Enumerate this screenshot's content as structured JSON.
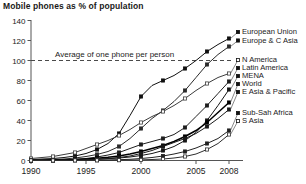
{
  "chart_data": {
    "type": "line",
    "title": "Mobile phones as % of population",
    "xlabel": "",
    "ylabel": "",
    "xlim": [
      1990,
      2008
    ],
    "ylim": [
      0,
      140
    ],
    "yticks": [
      0,
      20,
      40,
      60,
      80,
      100,
      120,
      140
    ],
    "xticks": [
      1990,
      1995,
      2000,
      2005,
      2008
    ],
    "xtick_labels": [
      "1990",
      "1995",
      "2000",
      "2005",
      "2008"
    ],
    "ytick_labels": [
      "0",
      "20",
      "40",
      "60",
      "80",
      "100",
      "120",
      "140"
    ],
    "grid": false,
    "legend_position": "right-inline",
    "annotations": [
      {
        "text": "Average of one phone per person",
        "y": 100,
        "x": 1997.6,
        "style": "dashed-reference-line"
      }
    ],
    "x": [
      1990,
      1991,
      1992,
      1993,
      1994,
      1995,
      1996,
      1997,
      1998,
      1999,
      2000,
      2001,
      2002,
      2003,
      2004,
      2005,
      2006,
      2007,
      2008
    ],
    "series": [
      {
        "name": "European Union",
        "marker": "filled-square",
        "values": [
          1,
          1.5,
          2,
          3,
          4.5,
          7,
          11,
          17,
          27,
          45,
          64,
          75,
          80,
          85,
          92,
          100,
          109,
          116,
          122
        ]
      },
      {
        "name": "Europe & C Asia",
        "marker": "filled-square",
        "values": [
          0.5,
          0.7,
          1,
          1.5,
          2.5,
          4,
          6,
          9,
          14,
          22,
          32,
          42,
          50,
          59,
          70,
          83,
          96,
          106,
          114
        ]
      },
      {
        "name": "N America",
        "marker": "open-square",
        "values": [
          2,
          3,
          4,
          6,
          8,
          12,
          16,
          20,
          25,
          31,
          38,
          44,
          49,
          55,
          62,
          70,
          77,
          83,
          87
        ]
      },
      {
        "name": "Latin America",
        "marker": "filled-square",
        "values": [
          0.2,
          0.3,
          0.5,
          0.8,
          1.2,
          2,
          3.5,
          5.5,
          8,
          12,
          16,
          19,
          22,
          26,
          33,
          44,
          55,
          67,
          79
        ]
      },
      {
        "name": "MENA",
        "marker": "filled-square",
        "values": [
          0.1,
          0.15,
          0.2,
          0.3,
          0.5,
          0.8,
          1.2,
          1.8,
          2.5,
          3.5,
          5,
          7,
          10,
          14,
          20,
          28,
          40,
          55,
          71
        ]
      },
      {
        "name": "World",
        "marker": "filled-square",
        "values": [
          0.2,
          0.3,
          0.4,
          0.6,
          0.9,
          1.5,
          2.2,
          3.2,
          4.5,
          6.5,
          9,
          12,
          15,
          19,
          24,
          30,
          38,
          48,
          58
        ]
      },
      {
        "name": "E Asia & Pacific",
        "marker": "filled-square",
        "values": [
          0.1,
          0.15,
          0.2,
          0.3,
          0.5,
          0.8,
          1.3,
          2,
          3,
          4.5,
          7,
          10,
          14,
          18,
          22,
          27,
          34,
          42,
          51
        ]
      },
      {
        "name": "Sub-Sah Africa",
        "marker": "filled-square",
        "values": [
          0.05,
          0.05,
          0.08,
          0.1,
          0.15,
          0.2,
          0.3,
          0.5,
          0.8,
          1.2,
          2,
          3,
          4.5,
          6.5,
          9,
          12.5,
          17,
          22,
          30
        ]
      },
      {
        "name": "S Asia",
        "marker": "open-square",
        "values": [
          0.02,
          0.02,
          0.03,
          0.05,
          0.08,
          0.1,
          0.15,
          0.2,
          0.3,
          0.4,
          0.6,
          1,
          1.5,
          2.5,
          4,
          6.5,
          11,
          17,
          26
        ]
      }
    ]
  }
}
